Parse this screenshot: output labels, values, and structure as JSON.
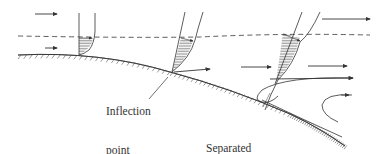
{
  "diagram": {
    "type": "boundary-layer-separation",
    "labels": {
      "inflection_line1": "Inflection",
      "inflection_line2": "point",
      "separated_line1": "Separated",
      "separated_line2": "flow"
    },
    "elements": {
      "wall": "curved surface with hatching",
      "boundary_layer_edge": "dashed line",
      "velocity_profiles": [
        "upstream profile",
        "inflection-point profile",
        "separated profile"
      ],
      "flow_arrows": "free-stream and near-wall arrows",
      "recirculation": "reversed flow curves"
    },
    "colors": {
      "stroke": "#333333",
      "background": "#ffffff"
    }
  }
}
